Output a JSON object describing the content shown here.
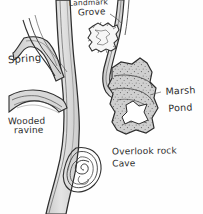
{
  "map": {
    "title": "Hand-drawn sketch map",
    "medium": "pencil and ink sketch on white paper",
    "background_color": "#fefefe",
    "ink_color": "#2b2b2b",
    "water_fill_color": "#d6d6d6",
    "marsh_fill_color": "#cfcfcf",
    "pond_fill_color": "#ffffff",
    "labels": [
      {
        "name": "landmark-grove",
        "line1": "Landmark",
        "line2": "Grove",
        "feature": "jagged tree-grove blob near top center"
      },
      {
        "name": "spring",
        "line1": "Spring",
        "line2": "",
        "feature": "stream head at upper left"
      },
      {
        "name": "wooded-ravine",
        "line1": "Wooded",
        "line2": "ravine",
        "feature": "elongated contoured gully at left"
      },
      {
        "name": "marsh-pond",
        "line1": "Marsh",
        "line2": "Pond",
        "feature": "stippled wetland with open water at right"
      },
      {
        "name": "overlook-rock-cave",
        "line1": "Overlook rock",
        "line2": "Cave",
        "feature": "spiral contour rock outcrop at lower center"
      }
    ],
    "features": [
      "main river running top to bottom",
      "spring-fed tributary from upper left",
      "tributary from upper right",
      "wooded ravine joining from the west",
      "marsh pond on the east bank",
      "overlook rock cave spiral below the junction"
    ]
  }
}
